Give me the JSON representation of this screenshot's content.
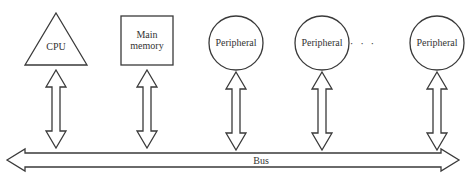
{
  "diagram": {
    "type": "bus-architecture",
    "colors": {
      "stroke": "#3a3a3a",
      "text": "#333333",
      "background": "#ffffff"
    },
    "components": [
      {
        "id": "cpu",
        "shape": "triangle",
        "label": "CPU"
      },
      {
        "id": "main-memory",
        "shape": "square",
        "label_line1": "Main",
        "label_line2": "memory"
      },
      {
        "id": "peripheral-1",
        "shape": "circle",
        "label": "Peripheral"
      },
      {
        "id": "peripheral-2",
        "shape": "circle",
        "label": "Peripheral"
      },
      {
        "id": "peripheral-n",
        "shape": "circle",
        "label": "Peripheral"
      }
    ],
    "ellipsis": "· · ·",
    "bus": {
      "label": "Bus",
      "direction": "bidirectional"
    },
    "connections": [
      {
        "from": "cpu",
        "to": "bus",
        "direction": "bidirectional"
      },
      {
        "from": "main-memory",
        "to": "bus",
        "direction": "bidirectional"
      },
      {
        "from": "peripheral-1",
        "to": "bus",
        "direction": "bidirectional"
      },
      {
        "from": "peripheral-2",
        "to": "bus",
        "direction": "bidirectional"
      },
      {
        "from": "peripheral-n",
        "to": "bus",
        "direction": "bidirectional"
      }
    ]
  }
}
